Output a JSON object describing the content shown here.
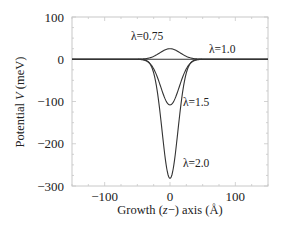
{
  "chart_data": {
    "type": "line",
    "title": "",
    "xlabel": "Growth (z−) axis (Å)",
    "xlabel_parts": {
      "pre": "Growth (",
      "var": "z",
      "post": "−) axis (Å)"
    },
    "ylabel": "Potential V (meV)",
    "ylabel_parts": {
      "pre": "Potential ",
      "var": "V",
      "post": " (meV)"
    },
    "xlim": [
      -150,
      150
    ],
    "ylim": [
      -300,
      100
    ],
    "xticks": [
      -100,
      0,
      100
    ],
    "xtick_labels": [
      "−100",
      "0",
      "100"
    ],
    "yticks": [
      100,
      0,
      -100,
      -200,
      -300
    ],
    "ytick_labels": [
      "100",
      "0",
      "−100",
      "−200",
      "−300"
    ],
    "grid": false,
    "legend": "inline labels",
    "curve_shape": "gaussian-like well centered at z=0, width ~20 Å",
    "series": [
      {
        "name": "λ=0.75",
        "label": "λ=0.75",
        "extremum_z": 0,
        "extremum_V": 25,
        "width": 22,
        "label_pos": [
          -35,
          45
        ]
      },
      {
        "name": "λ=1.0",
        "label": "λ=1.0",
        "extremum_z": 0,
        "extremum_V": 0,
        "width": 22,
        "label_pos": [
          80,
          14
        ]
      },
      {
        "name": "λ=1.5",
        "label": "λ=1.5",
        "extremum_z": 0,
        "extremum_V": -108,
        "width": 20,
        "label_pos": [
          40,
          -110
        ]
      },
      {
        "name": "λ=2.0",
        "label": "λ=2.0",
        "extremum_z": 0,
        "extremum_V": -282,
        "width": 17,
        "label_pos": [
          40,
          -255
        ]
      }
    ],
    "line_color": "#333333"
  }
}
